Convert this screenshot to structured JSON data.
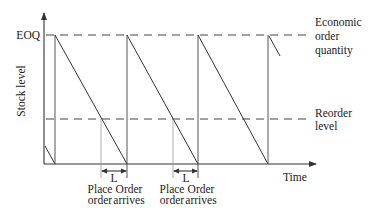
{
  "diagram": {
    "y_axis_label": "Stock level",
    "x_axis_label": "Time",
    "y_tick_label": "EOQ",
    "eoq_label_lines": [
      "Economic",
      "order",
      "quantity"
    ],
    "reorder_label_lines": [
      "Reorder",
      "level"
    ],
    "lead_time_label": "L",
    "place_order_lines": [
      "Place",
      "order"
    ],
    "order_arrives_lines": [
      "Order",
      "arrives"
    ],
    "colors": {
      "line": "#333333",
      "text": "#222222",
      "background": "#ffffff"
    }
  }
}
